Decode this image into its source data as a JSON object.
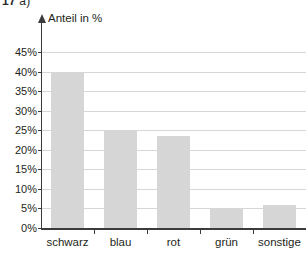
{
  "header": {
    "exercise_number": "17",
    "part_label": "a)"
  },
  "chart_data": {
    "type": "bar",
    "title": "",
    "subtitle": "",
    "xlabel": "",
    "ylabel": "Anteil in %",
    "categories": [
      "schwarz",
      "blau",
      "rot",
      "grün",
      "sonstige"
    ],
    "values": [
      40,
      25,
      23.5,
      5,
      6
    ],
    "value_labels": [
      "40%",
      "25%",
      "23,5%",
      "5%",
      "6%"
    ],
    "ylim": [
      0,
      45
    ],
    "ytick_step": 5,
    "ytick_labels": [
      "0%",
      "5%",
      "10%",
      "15%",
      "20%",
      "25%",
      "30%",
      "35%",
      "40%",
      "45%"
    ],
    "ytick_values": [
      0,
      5,
      10,
      15,
      20,
      25,
      30,
      35,
      40,
      45
    ],
    "grid": true,
    "grid_axis": "y",
    "legend": false,
    "legend_position": "none",
    "bar_color": "#d6d6d6",
    "axis_color": "#3b3b3b",
    "grid_color": "#d7d7d7",
    "background_color": "#ffffff",
    "y_axis_has_arrow": true
  }
}
